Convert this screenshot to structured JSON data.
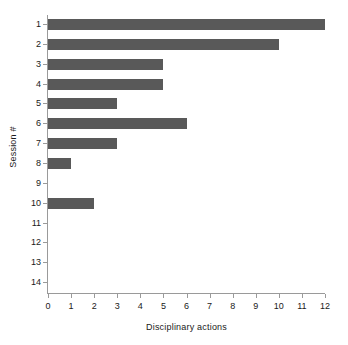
{
  "chart_data": {
    "type": "bar",
    "orientation": "horizontal",
    "title": "",
    "xlabel": "Disciplinary actions",
    "ylabel": "Session #",
    "categories": [
      "1",
      "2",
      "3",
      "4",
      "5",
      "6",
      "7",
      "8",
      "9",
      "10",
      "11",
      "12",
      "13",
      "14"
    ],
    "values": [
      12,
      10,
      5,
      5,
      3,
      6,
      3,
      1,
      0,
      2,
      0,
      0,
      0,
      0
    ],
    "xlim": [
      0,
      12
    ],
    "xticks": [
      "0",
      "1",
      "2",
      "3",
      "4",
      "5",
      "6",
      "7",
      "8",
      "9",
      "10",
      "11",
      "12"
    ],
    "grid": false,
    "legend": null,
    "bar_color": "#595959",
    "axis_color": "#9a9a9a"
  }
}
